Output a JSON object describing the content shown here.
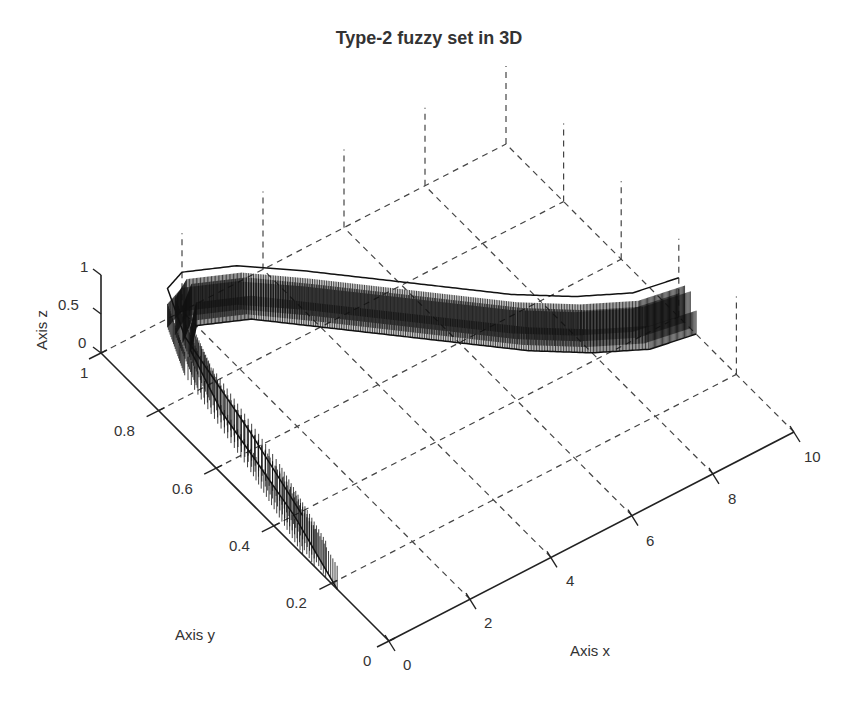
{
  "chart_data": {
    "type": "surface3d",
    "title": "Type-2 fuzzy set in 3D",
    "xlabel": "Axis x",
    "ylabel": "Axis y",
    "zlabel": "Axis z",
    "xlim": [
      0,
      10
    ],
    "ylim": [
      0,
      1
    ],
    "zlim": [
      0,
      1
    ],
    "x_ticks": [
      "0",
      "2",
      "4",
      "6",
      "8",
      "10"
    ],
    "y_ticks": [
      "0",
      "0.2",
      "0.4",
      "0.6",
      "0.8",
      "1"
    ],
    "z_ticks": [
      "0",
      "0.5",
      "1"
    ],
    "grid": true,
    "grid_style": "dashed",
    "primary_mf": {
      "x": [
        0,
        0.5,
        1.0,
        1.5,
        2,
        3,
        4,
        5,
        6,
        7,
        8,
        9,
        10
      ],
      "upper": [
        0.3,
        0.55,
        0.85,
        0.98,
        1.0,
        0.95,
        0.86,
        0.76,
        0.66,
        0.56,
        0.48,
        0.42,
        0.4
      ],
      "lower": [
        0.18,
        0.4,
        0.72,
        0.9,
        0.95,
        0.9,
        0.8,
        0.7,
        0.6,
        0.5,
        0.42,
        0.36,
        0.34
      ]
    },
    "secondary_height": 0.5
  },
  "colors": {
    "axis": "#222222",
    "grid": "#444444",
    "surface": "#111111",
    "text": "#333333"
  }
}
